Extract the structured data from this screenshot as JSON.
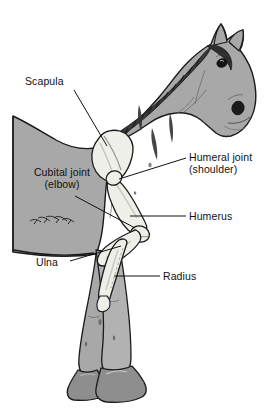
{
  "figure": {
    "kind": "anatomical-illustration",
    "colors": {
      "background": "#ffffff",
      "body_fill": "#a8a8a8",
      "body_shadow": "#989898",
      "bone_fill": "#efefe9",
      "bone_shadow": "#d8d8d0",
      "hoof_fill": "#8e8e8e",
      "outline": "#1a1a1a",
      "mane": "#2b2b2b",
      "leader_line": "#111111",
      "text": "#111111"
    }
  },
  "labels": {
    "scapula": {
      "text": "Scapula"
    },
    "cubital_joint": {
      "line1": "Cubital joint",
      "line2": "(elbow)"
    },
    "humeral_joint": {
      "line1": "Humeral joint",
      "line2": "(shoulder)"
    },
    "humerus": {
      "text": "Humerus"
    },
    "ulna": {
      "text": "Ulna"
    },
    "radius": {
      "text": "Radius"
    }
  }
}
